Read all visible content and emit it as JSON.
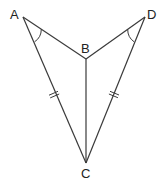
{
  "diagram": {
    "type": "geometry",
    "colors": {
      "stroke": "#3a3a3a",
      "label": "#222222",
      "background": "#ffffff"
    },
    "points": {
      "A": {
        "label": "A",
        "x": 23,
        "y": 17
      },
      "B": {
        "label": "B",
        "x": 86,
        "y": 59
      },
      "C": {
        "label": "C",
        "x": 86,
        "y": 163
      },
      "D": {
        "label": "D",
        "x": 145,
        "y": 17
      }
    },
    "segments": [
      {
        "from": "A",
        "to": "B"
      },
      {
        "from": "A",
        "to": "C"
      },
      {
        "from": "B",
        "to": "C"
      },
      {
        "from": "D",
        "to": "B"
      },
      {
        "from": "D",
        "to": "C"
      }
    ],
    "congruence_marks": [
      {
        "segment": "AC",
        "ticks": 2
      },
      {
        "segment": "DC",
        "ticks": 2
      }
    ],
    "angle_marks": [
      {
        "vertex": "A",
        "between": [
          "B",
          "C"
        ],
        "arcs": 1
      },
      {
        "vertex": "D",
        "between": [
          "B",
          "C"
        ],
        "arcs": 1
      }
    ]
  }
}
